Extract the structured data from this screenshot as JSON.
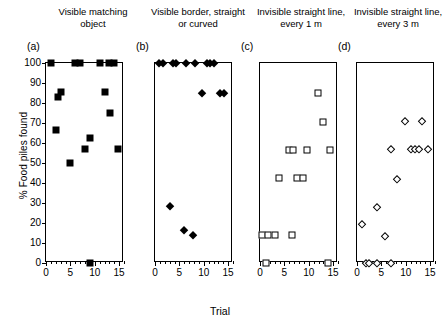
{
  "figure": {
    "xlabel": "Trial",
    "ylabel": "% Food piles found"
  },
  "chart_data": {
    "type": "scatter",
    "title": "",
    "xlabel": "Trial",
    "ylabel": "% Food piles found",
    "xlim": [
      0,
      16
    ],
    "ylim": [
      0,
      100
    ],
    "yticks": [
      0,
      10,
      20,
      30,
      40,
      50,
      60,
      70,
      80,
      90,
      100
    ],
    "xticks": [
      0,
      5,
      10,
      15
    ],
    "grid": false,
    "legend": "none",
    "shared_y_axis_on_panel": "a",
    "panels": [
      {
        "letter": "(a)",
        "title": "Visible matching object",
        "marker": "filled-square",
        "points": [
          {
            "x": 1.0,
            "y": 100
          },
          {
            "x": 6.0,
            "y": 100
          },
          {
            "x": 7.0,
            "y": 100
          },
          {
            "x": 11.0,
            "y": 100
          },
          {
            "x": 13.0,
            "y": 100
          },
          {
            "x": 14.0,
            "y": 100
          },
          {
            "x": 2.5,
            "y": 83
          },
          {
            "x": 3.1,
            "y": 85.5
          },
          {
            "x": 12.0,
            "y": 85.5
          },
          {
            "x": 13.2,
            "y": 75
          },
          {
            "x": 2.0,
            "y": 66.5
          },
          {
            "x": 9.0,
            "y": 62.5
          },
          {
            "x": 8.0,
            "y": 57
          },
          {
            "x": 14.8,
            "y": 57
          },
          {
            "x": 5.0,
            "y": 50
          },
          {
            "x": 9.0,
            "y": 0
          }
        ]
      },
      {
        "letter": "(b)",
        "title": "Visible border, straight or curved",
        "marker": "filled-diamond",
        "points": [
          {
            "x": 0.9,
            "y": 100
          },
          {
            "x": 1.7,
            "y": 100
          },
          {
            "x": 3.6,
            "y": 100
          },
          {
            "x": 4.4,
            "y": 100
          },
          {
            "x": 6.3,
            "y": 100
          },
          {
            "x": 8.3,
            "y": 100
          },
          {
            "x": 10.6,
            "y": 100
          },
          {
            "x": 11.3,
            "y": 100
          },
          {
            "x": 12.0,
            "y": 100
          },
          {
            "x": 9.7,
            "y": 85
          },
          {
            "x": 13.4,
            "y": 85
          },
          {
            "x": 14.1,
            "y": 85
          },
          {
            "x": 3.0,
            "y": 28.5
          },
          {
            "x": 6.0,
            "y": 16.3
          },
          {
            "x": 7.7,
            "y": 14
          }
        ]
      },
      {
        "letter": "(c)",
        "title": "Invisible straight line, every 1 m",
        "marker": "open-square",
        "points": [
          {
            "x": 11.8,
            "y": 85
          },
          {
            "x": 12.9,
            "y": 70.5
          },
          {
            "x": 5.9,
            "y": 56.5
          },
          {
            "x": 6.7,
            "y": 56.5
          },
          {
            "x": 9.6,
            "y": 56.5
          },
          {
            "x": 14.3,
            "y": 56.5
          },
          {
            "x": 3.8,
            "y": 42.5
          },
          {
            "x": 7.6,
            "y": 42.5
          },
          {
            "x": 8.8,
            "y": 42.5
          },
          {
            "x": 0.5,
            "y": 14
          },
          {
            "x": 1.7,
            "y": 14
          },
          {
            "x": 3.0,
            "y": 14
          },
          {
            "x": 6.5,
            "y": 14
          },
          {
            "x": 1.3,
            "y": 0
          },
          {
            "x": 14.0,
            "y": 0
          }
        ]
      },
      {
        "letter": "(d)",
        "title": "Invisible straight line, every 3 m",
        "marker": "open-diamond",
        "points": [
          {
            "x": 9.8,
            "y": 71
          },
          {
            "x": 13.3,
            "y": 71
          },
          {
            "x": 6.9,
            "y": 57
          },
          {
            "x": 11.1,
            "y": 57
          },
          {
            "x": 11.9,
            "y": 57
          },
          {
            "x": 12.7,
            "y": 57
          },
          {
            "x": 14.6,
            "y": 57
          },
          {
            "x": 8.2,
            "y": 42
          },
          {
            "x": 4.0,
            "y": 28
          },
          {
            "x": 1.0,
            "y": 19.5
          },
          {
            "x": 5.8,
            "y": 13.5
          },
          {
            "x": 1.9,
            "y": 0
          },
          {
            "x": 2.5,
            "y": 0
          },
          {
            "x": 4.0,
            "y": 0
          },
          {
            "x": 7.0,
            "y": 0
          }
        ]
      }
    ]
  }
}
